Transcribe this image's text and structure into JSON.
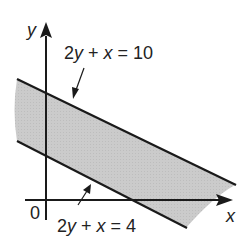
{
  "diagram": {
    "type": "linear-inequality-region",
    "axes": {
      "x_label": "x",
      "y_label": "y",
      "origin_label": "0"
    },
    "lines": [
      {
        "id": "upper",
        "equation": "2y + x = 10",
        "label_parts": [
          "2",
          "y",
          " + ",
          "x",
          " = 10"
        ]
      },
      {
        "id": "lower",
        "equation": "2y + x = 4",
        "label_parts": [
          "2",
          "y",
          " + ",
          "x",
          " = 4"
        ]
      }
    ],
    "shaded_region": "4 ≤ 2y + x ≤ 10",
    "colors": {
      "line": "#1a1a1a",
      "shade": "#c9c9c9",
      "background": "#ffffff",
      "text": "#222222"
    }
  }
}
